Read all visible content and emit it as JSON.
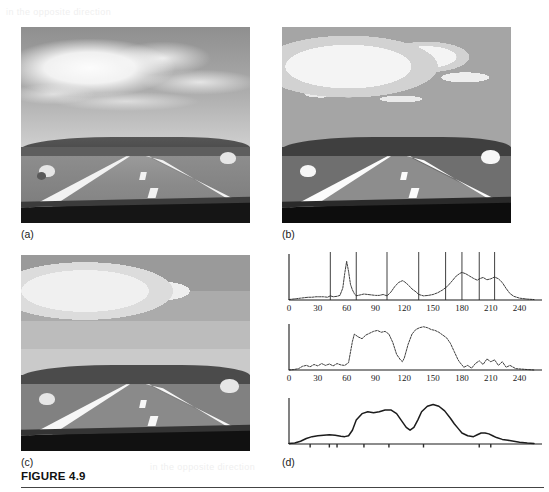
{
  "figure": {
    "caption": "FIGURE 4.9",
    "ghost_text": "in the opposite direction"
  },
  "panels": [
    {
      "id": "a",
      "label": "(a)",
      "description": "original grayscale road scene with sky, clouds, grass verges, two sheep and car hood"
    },
    {
      "id": "b",
      "label": "(b)",
      "description": "multilevel thresholded / posterised segmentation of the road scene"
    },
    {
      "id": "c",
      "label": "(c)",
      "description": "smoothed multilevel segmentation of the road scene"
    },
    {
      "id": "d",
      "label": "(d)",
      "description": "three histograms of the road scene image"
    }
  ],
  "chart_data": [
    {
      "id": "hist-original",
      "type": "line",
      "title": "",
      "xlabel": "",
      "ylabel": "",
      "xlim": [
        0,
        255
      ],
      "ylim": [
        0,
        100
      ],
      "grid": false,
      "legend": null,
      "xticks": [
        0,
        30,
        60,
        90,
        120,
        150,
        180,
        210,
        240
      ],
      "xticklabels": [
        "0",
        "30",
        "60",
        "90",
        "120",
        "150",
        "180",
        "210",
        "240"
      ],
      "annotations": {
        "name": "threshold-lines",
        "description": "vertical threshold lines from multilevel thresholding",
        "values": [
          43,
          70,
          102,
          135,
          163,
          180,
          198,
          214
        ]
      },
      "x": [
        0,
        4,
        8,
        12,
        16,
        20,
        24,
        28,
        32,
        36,
        40,
        43,
        46,
        50,
        53,
        56,
        58,
        60,
        62,
        64,
        66,
        68,
        70,
        74,
        78,
        82,
        86,
        90,
        94,
        98,
        102,
        106,
        110,
        114,
        118,
        120,
        124,
        128,
        132,
        135,
        140,
        145,
        150,
        155,
        160,
        165,
        170,
        174,
        178,
        180,
        184,
        188,
        192,
        196,
        198,
        202,
        206,
        210,
        214,
        218,
        222,
        226,
        230,
        234,
        240,
        248,
        255
      ],
      "y": [
        1,
        2,
        3,
        4,
        5,
        6,
        6,
        7,
        7,
        7,
        6,
        9,
        7,
        8,
        10,
        26,
        58,
        84,
        62,
        34,
        22,
        14,
        9,
        11,
        13,
        12,
        11,
        10,
        10,
        12,
        9,
        17,
        29,
        38,
        42,
        40,
        33,
        24,
        18,
        12,
        9,
        10,
        12,
        16,
        22,
        30,
        42,
        52,
        58,
        60,
        57,
        52,
        47,
        43,
        46,
        49,
        44,
        46,
        50,
        46,
        38,
        25,
        14,
        8,
        4,
        2,
        1
      ]
    },
    {
      "id": "hist-smoothed",
      "type": "line",
      "title": "",
      "xlabel": "",
      "ylabel": "",
      "xlim": [
        0,
        255
      ],
      "ylim": [
        0,
        100
      ],
      "grid": false,
      "legend": null,
      "xticks": [
        0,
        30,
        60,
        90,
        120,
        150,
        180,
        210,
        240
      ],
      "xticklabels": [
        "0",
        "30",
        "60",
        "90",
        "120",
        "150",
        "180",
        "210",
        "240"
      ],
      "annotations": null,
      "x": [
        0,
        5,
        10,
        14,
        18,
        22,
        26,
        30,
        34,
        38,
        42,
        46,
        50,
        54,
        58,
        62,
        66,
        68,
        72,
        76,
        80,
        84,
        88,
        92,
        96,
        100,
        104,
        108,
        112,
        116,
        118,
        120,
        124,
        128,
        132,
        136,
        140,
        144,
        148,
        152,
        156,
        160,
        164,
        168,
        172,
        176,
        178,
        182,
        186,
        190,
        194,
        198,
        202,
        206,
        210,
        214,
        218,
        222,
        226,
        230,
        236,
        242,
        248,
        255
      ],
      "y": [
        0,
        1,
        3,
        8,
        10,
        7,
        12,
        9,
        14,
        10,
        13,
        9,
        14,
        11,
        10,
        16,
        62,
        78,
        72,
        68,
        76,
        80,
        84,
        86,
        82,
        84,
        78,
        60,
        34,
        22,
        18,
        26,
        56,
        78,
        88,
        92,
        94,
        92,
        88,
        86,
        82,
        76,
        70,
        58,
        40,
        22,
        16,
        6,
        10,
        4,
        14,
        20,
        12,
        24,
        18,
        22,
        10,
        18,
        6,
        10,
        3,
        2,
        1,
        0
      ]
    },
    {
      "id": "hist-final-smooth",
      "type": "line",
      "title": "",
      "xlabel": "",
      "ylabel": "",
      "xlim": [
        0,
        255
      ],
      "ylim": [
        0,
        100
      ],
      "grid": false,
      "legend": null,
      "xticks": [],
      "xticklabels": [],
      "annotations": {
        "name": "tick-marks",
        "description": "unlabeled tick marks along the baseline",
        "values": [
          22,
          42,
          50,
          78,
          104,
          140,
          198,
          210
        ]
      },
      "x": [
        0,
        6,
        12,
        18,
        24,
        30,
        36,
        42,
        48,
        54,
        58,
        62,
        66,
        70,
        76,
        82,
        88,
        94,
        100,
        106,
        112,
        118,
        122,
        126,
        130,
        134,
        138,
        144,
        150,
        156,
        162,
        168,
        172,
        176,
        180,
        186,
        192,
        196,
        200,
        204,
        208,
        212,
        216,
        222,
        228,
        234,
        240,
        248,
        255
      ],
      "y": [
        1,
        2,
        6,
        12,
        16,
        18,
        19,
        20,
        19,
        17,
        16,
        18,
        30,
        52,
        66,
        70,
        68,
        70,
        74,
        74,
        66,
        48,
        36,
        30,
        36,
        52,
        70,
        82,
        86,
        82,
        72,
        56,
        44,
        34,
        24,
        18,
        16,
        20,
        24,
        24,
        22,
        18,
        14,
        10,
        8,
        6,
        4,
        2,
        1
      ]
    }
  ]
}
